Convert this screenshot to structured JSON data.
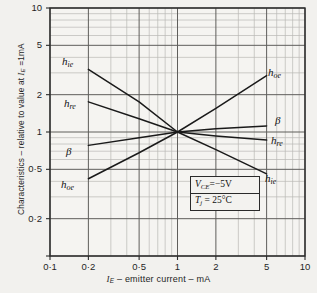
{
  "chart_data": {
    "type": "line",
    "title": "",
    "xlabel": "I_E – emitter current – mA",
    "ylabel": "Characteristics – relative to value at I_E = 1mA",
    "xscale": "log",
    "yscale": "log",
    "xlim": [
      0.1,
      10
    ],
    "ylim": [
      0.1,
      10
    ],
    "grid": true,
    "legend": "inline-curve-labels",
    "xticks": [
      "0·1",
      "0·2",
      "0·5",
      "1",
      "2",
      "5",
      "10"
    ],
    "xtick_values": [
      0.1,
      0.2,
      0.5,
      1,
      2,
      5,
      10
    ],
    "yticks": [
      "0·2",
      "0·5",
      "1",
      "2",
      "5",
      "10"
    ],
    "ytick_values": [
      0.2,
      0.5,
      1,
      2,
      5,
      10
    ],
    "series": [
      {
        "name": "h_ie",
        "label": "h",
        "sub": "ie",
        "x": [
          0.2,
          0.5,
          1,
          2,
          5
        ],
        "y": [
          3.2,
          1.75,
          1.0,
          0.72,
          0.46
        ]
      },
      {
        "name": "h_re",
        "label": "h",
        "sub": "re",
        "x": [
          0.2,
          0.5,
          1,
          2,
          5
        ],
        "y": [
          1.75,
          1.28,
          1.0,
          0.93,
          0.86
        ]
      },
      {
        "name": "beta",
        "label": "β",
        "sub": "",
        "x": [
          0.2,
          0.5,
          1,
          2,
          5
        ],
        "y": [
          0.78,
          0.9,
          1.0,
          1.06,
          1.12
        ]
      },
      {
        "name": "h_oe",
        "label": "h",
        "sub": "oe",
        "x": [
          0.2,
          0.5,
          1,
          2,
          5
        ],
        "y": [
          0.42,
          0.68,
          1.0,
          1.55,
          2.85
        ]
      }
    ],
    "annotations": [
      {
        "id": "vce",
        "text": "VCE=−5V",
        "base": "V",
        "sub": "CE",
        "rest": "=−5V"
      },
      {
        "id": "tj",
        "text": "Tj = 25°C",
        "base": "T",
        "sub": "j",
        "rest": " = 25°C"
      }
    ],
    "curve_labels_left": [
      {
        "series": "h_ie",
        "base": "h",
        "sub": "ie",
        "x": 62,
        "y": 55
      },
      {
        "series": "h_re",
        "base": "h",
        "sub": "re",
        "x": 64,
        "y": 97
      },
      {
        "series": "beta",
        "base": "β",
        "sub": "",
        "x": 66,
        "y": 145
      },
      {
        "series": "h_oe",
        "base": "h",
        "sub": "oe",
        "x": 61,
        "y": 178
      }
    ],
    "curve_labels_right": [
      {
        "series": "h_oe",
        "base": "h",
        "sub": "oe",
        "x": 268,
        "y": 66
      },
      {
        "series": "beta",
        "base": "β",
        "sub": "",
        "x": 275,
        "y": 114
      },
      {
        "series": "h_re",
        "base": "h",
        "sub": "re",
        "x": 271,
        "y": 134
      },
      {
        "series": "h_ie",
        "base": "h",
        "sub": "ie",
        "x": 265,
        "y": 172
      }
    ]
  },
  "axes": {
    "ylabel_parts": {
      "main": "Characteristics – relative to value at ",
      "sym": "I",
      "sub": "E",
      "tail": " =1mA"
    },
    "xlabel_parts": {
      "sym": "I",
      "sub": "E",
      "tail": " – emitter current – mA"
    }
  },
  "colors": {
    "background": "#f2f1ee",
    "plot_background": "#f5f4f1",
    "grid_minor": "#b9b8b4",
    "grid_major": "#6e6d6a",
    "curve": "#1a1a1a",
    "frame": "#2a2a2a",
    "text": "#1f1f1f"
  }
}
